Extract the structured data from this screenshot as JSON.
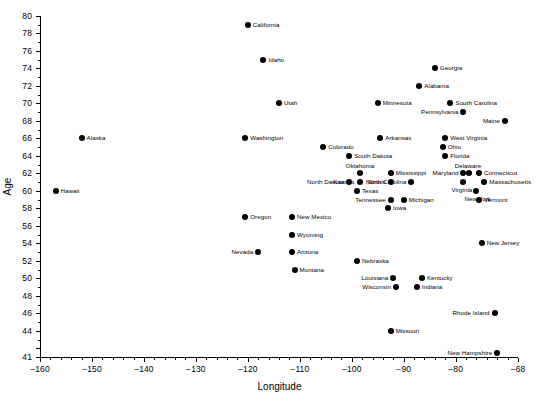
{
  "chart_data": {
    "type": "scatter",
    "title": "",
    "xlabel": "Longitude",
    "ylabel": "Age",
    "xlim": [
      -160,
      -68
    ],
    "ylim": [
      41,
      80
    ],
    "grid": false,
    "legend": "none",
    "xticks": [
      -160,
      -150,
      -140,
      -130,
      -120,
      -110,
      -100,
      -90,
      -80,
      -68
    ],
    "xtick_labels": [
      "-160",
      "-150",
      "-140",
      "-130",
      "-120",
      "-110",
      "-100",
      "-90",
      "-80",
      "-68"
    ],
    "yticks": [
      41,
      42,
      44,
      46,
      48,
      50,
      52,
      54,
      56,
      58,
      60,
      62,
      64,
      66,
      68,
      70,
      72,
      74,
      76,
      78,
      80
    ],
    "ytick_labels": [
      "41",
      "",
      "44",
      "46",
      "48",
      "50",
      "52",
      "54",
      "56",
      "58",
      "60",
      "62",
      "64",
      "66",
      "68",
      "70",
      "72",
      "74",
      "76",
      "78",
      "80"
    ],
    "marker_color": "#000000",
    "points": [
      {
        "label": "Hawaii",
        "x": -157.0,
        "y": 60,
        "side": "right"
      },
      {
        "label": "Alaska",
        "x": -152.0,
        "y": 66,
        "side": "right"
      },
      {
        "label": "California",
        "x": -120.0,
        "y": 79,
        "side": "right"
      },
      {
        "label": "Washington",
        "x": -120.5,
        "y": 66,
        "side": "right"
      },
      {
        "label": "Oregon",
        "x": -120.5,
        "y": 57,
        "side": "right"
      },
      {
        "label": "Nevada",
        "x": -118.0,
        "y": 53,
        "side": "left"
      },
      {
        "label": "Idaho",
        "x": -117.0,
        "y": 75,
        "side": "right"
      },
      {
        "label": "Utah",
        "x": -114.0,
        "y": 70,
        "side": "right"
      },
      {
        "label": "Arizona",
        "x": -111.5,
        "y": 53,
        "side": "right"
      },
      {
        "label": "Montana",
        "x": -111.0,
        "y": 51,
        "side": "right"
      },
      {
        "label": "Colorado",
        "x": -105.5,
        "y": 65,
        "side": "right"
      },
      {
        "label": "Wyoming",
        "x": -111.5,
        "y": 55,
        "side": "right"
      },
      {
        "label": "New Mexico",
        "x": -111.5,
        "y": 57,
        "side": "right"
      },
      {
        "label": "North Dakota",
        "x": -100.5,
        "y": 61,
        "side": "left"
      },
      {
        "label": "South Dakota",
        "x": -100.5,
        "y": 64,
        "side": "right"
      },
      {
        "label": "Oklahoma",
        "x": -98.5,
        "y": 62,
        "side": "top"
      },
      {
        "label": "Kansas",
        "x": -98.5,
        "y": 61,
        "side": "left"
      },
      {
        "label": "Texas",
        "x": -99.0,
        "y": 60,
        "side": "right"
      },
      {
        "label": "Nebraska",
        "x": -99.0,
        "y": 52,
        "side": "right"
      },
      {
        "label": "Louisiana",
        "x": -92.0,
        "y": 50,
        "side": "left"
      },
      {
        "label": "Wisconsin",
        "x": -91.5,
        "y": 49,
        "side": "left"
      },
      {
        "label": "Minnesota",
        "x": -95.0,
        "y": 70,
        "side": "right"
      },
      {
        "label": "Arkansas",
        "x": -94.5,
        "y": 66,
        "side": "right"
      },
      {
        "label": "Mississippi",
        "x": -92.5,
        "y": 62,
        "side": "right"
      },
      {
        "label": "Illinois",
        "x": -92.5,
        "y": 61,
        "side": "left"
      },
      {
        "label": "Tennessee",
        "x": -92.5,
        "y": 59,
        "side": "left"
      },
      {
        "label": "Iowa",
        "x": -93.0,
        "y": 58,
        "side": "right"
      },
      {
        "label": "Missouri",
        "x": -92.5,
        "y": 44,
        "side": "right"
      },
      {
        "label": "North Carolina",
        "x": -88.5,
        "y": 61,
        "side": "left"
      },
      {
        "label": "Michigan",
        "x": -90.0,
        "y": 59,
        "side": "right"
      },
      {
        "label": "Indiana",
        "x": -87.5,
        "y": 49,
        "side": "right"
      },
      {
        "label": "Kentucky",
        "x": -86.5,
        "y": 50,
        "side": "right"
      },
      {
        "label": "Alabama",
        "x": -87.0,
        "y": 72,
        "side": "right"
      },
      {
        "label": "Georgia",
        "x": -84.0,
        "y": 74,
        "side": "right"
      },
      {
        "label": "Ohio",
        "x": -82.5,
        "y": 65,
        "side": "right"
      },
      {
        "label": "Florida",
        "x": -82.0,
        "y": 64,
        "side": "right"
      },
      {
        "label": "West Virginia",
        "x": -82.0,
        "y": 66,
        "side": "right"
      },
      {
        "label": "South Carolina",
        "x": -81.0,
        "y": 70,
        "side": "right"
      },
      {
        "label": "Pennsylvania",
        "x": -78.5,
        "y": 69,
        "side": "left"
      },
      {
        "label": "Maryland",
        "x": -78.5,
        "y": 62,
        "side": "left"
      },
      {
        "label": "Delaware",
        "x": -77.5,
        "y": 62,
        "side": "top"
      },
      {
        "label": "Virginia",
        "x": -78.5,
        "y": 61,
        "side": "bottom"
      },
      {
        "label": "Connecticut",
        "x": -75.5,
        "y": 62,
        "side": "right"
      },
      {
        "label": "Massachusetts",
        "x": -74.5,
        "y": 61,
        "side": "right"
      },
      {
        "label": "New York",
        "x": -76.0,
        "y": 60,
        "side": "bottom"
      },
      {
        "label": "Vermont",
        "x": -75.5,
        "y": 59,
        "side": "right"
      },
      {
        "label": "New Jersey",
        "x": -75.0,
        "y": 54,
        "side": "right"
      },
      {
        "label": "Rhode Island",
        "x": -72.5,
        "y": 46,
        "side": "left"
      },
      {
        "label": "New Hampshire",
        "x": -72.0,
        "y": 41.5,
        "side": "left"
      },
      {
        "label": "Maine",
        "x": -70.5,
        "y": 68,
        "side": "left"
      }
    ]
  }
}
